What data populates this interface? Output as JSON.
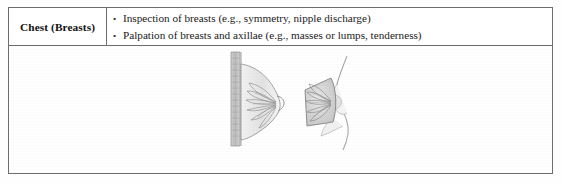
{
  "table": {
    "row_label": "Chest (Breasts)",
    "bullet_marker": "•",
    "bullets": [
      "Inspection of breasts (e.g., symmetry, nipple discharge)",
      "Palpation of breasts and axillae (e.g., masses or lumps, tenderness)"
    ],
    "border_color": "#6d6d6d",
    "background_color": "#ffffff"
  },
  "illustration": {
    "caption": "",
    "figures": [
      {
        "name": "breast-sagittal-cross-section",
        "description": "Sagittal cross-section of breast showing chest wall, pectoral muscle, glandular lobules and ducts converging at the nipple"
      },
      {
        "name": "breast-oblique-cutaway",
        "description": "Oblique view of breast profile with cutaway wedge revealing lobules radiating toward the areola and nipple"
      }
    ],
    "line_color": "#8d8d8d",
    "fill_color": "#d9d9d9"
  }
}
